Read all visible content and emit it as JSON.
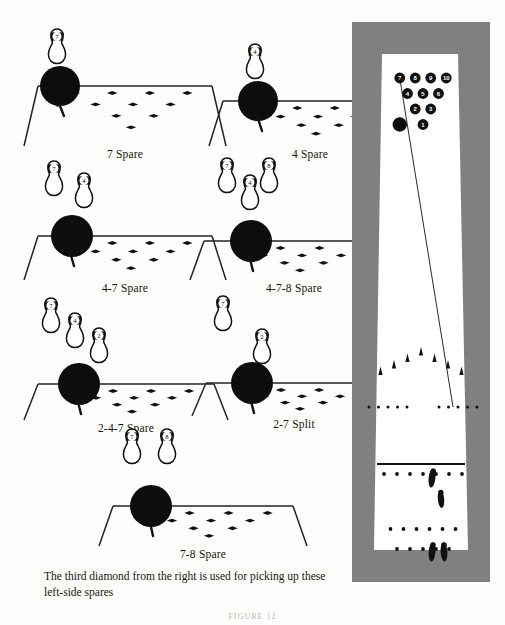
{
  "document": {
    "caption": "The third diamond from the right is used for picking up these left-side spares",
    "figure_label": "FIGURE 12"
  },
  "diagram_colors": {
    "ink": "#111111",
    "paper": "#ffffff",
    "page": "#fdfdfb",
    "mat": "#808080",
    "ball": "#0d0d0d",
    "pin_fill": "#ffffff",
    "pin_stroke": "#111111",
    "lane_line": "#222222"
  },
  "panels": [
    {
      "id": "panel-7-spare",
      "label": "7 Spare",
      "x": 30,
      "y": 28,
      "w": 190,
      "h": 118,
      "ball": {
        "cx": 30,
        "cy": 58,
        "r": 20
      },
      "arrow": {
        "x": 34,
        "y": 88,
        "angle": -22
      },
      "pins": [
        {
          "num": "7",
          "cx": 27,
          "cy": 18
        }
      ]
    },
    {
      "id": "panel-4-spare",
      "label": "4 Spare",
      "x": 215,
      "y": 28,
      "w": 190,
      "h": 118,
      "ball": {
        "cx": 43,
        "cy": 73,
        "r": 20
      },
      "arrow": {
        "x": 47,
        "y": 103,
        "angle": -18
      },
      "pins": [
        {
          "num": "4",
          "cx": 40,
          "cy": 33
        }
      ]
    },
    {
      "id": "panel-4-7-spare",
      "label": "4-7 Spare",
      "x": 30,
      "y": 158,
      "w": 190,
      "h": 122,
      "ball": {
        "cx": 42,
        "cy": 78,
        "r": 21
      },
      "arrow": {
        "x": 44,
        "y": 108,
        "angle": -16
      },
      "pins": [
        {
          "num": "7",
          "cx": 24,
          "cy": 20
        },
        {
          "num": "4",
          "cx": 54,
          "cy": 32
        }
      ]
    },
    {
      "id": "panel-4-7-8-spare",
      "label": "4-7-8 Spare",
      "x": 196,
      "y": 155,
      "w": 196,
      "h": 125,
      "ball": {
        "cx": 55,
        "cy": 86,
        "r": 21
      },
      "arrow": {
        "x": 57,
        "y": 116,
        "angle": -14
      },
      "pins": [
        {
          "num": "7",
          "cx": 31,
          "cy": 20
        },
        {
          "num": "4",
          "cx": 54,
          "cy": 37
        },
        {
          "num": "8",
          "cx": 73,
          "cy": 20
        }
      ]
    },
    {
      "id": "panel-2-4-7-spare",
      "label": "2-4-7 Spare",
      "x": 30,
      "y": 296,
      "w": 192,
      "h": 124,
      "ball": {
        "cx": 49,
        "cy": 88,
        "r": 21
      },
      "arrow": {
        "x": 51,
        "y": 118,
        "angle": -14
      },
      "pins": [
        {
          "num": "7",
          "cx": 21,
          "cy": 19
        },
        {
          "num": "4",
          "cx": 45,
          "cy": 34
        },
        {
          "num": "2",
          "cx": 69,
          "cy": 49
        }
      ]
    },
    {
      "id": "panel-2-7-split",
      "label": "2-7 Split",
      "x": 198,
      "y": 292,
      "w": 192,
      "h": 124,
      "ball": {
        "cx": 54,
        "cy": 91,
        "r": 21
      },
      "arrow": {
        "x": 56,
        "y": 121,
        "angle": -14
      },
      "pins": [
        {
          "num": "7",
          "cx": 25,
          "cy": 21
        },
        {
          "num": "2",
          "cx": 64,
          "cy": 54
        }
      ]
    },
    {
      "id": "panel-7-8-spare",
      "label": "7-8 Spare",
      "x": 105,
      "y": 428,
      "w": 196,
      "h": 118,
      "ball": {
        "cx": 46,
        "cy": 78,
        "r": 21
      },
      "arrow": {
        "x": 48,
        "y": 108,
        "angle": -12
      },
      "pins": [
        {
          "num": "7",
          "cx": 27,
          "cy": 18
        },
        {
          "num": "8",
          "cx": 62,
          "cy": 18
        }
      ]
    }
  ],
  "panel_lane": {
    "description": "trapezoid lane-end view with ten diamond aiming markers",
    "diamond_rows": [
      {
        "count": 4,
        "label": "back-row-diamonds"
      },
      {
        "count": 3,
        "label": "middle-row-diamonds"
      },
      {
        "count": 2,
        "label": "front-row-diamonds"
      },
      {
        "count": 1,
        "label": "apex-diamond"
      }
    ]
  },
  "lane_view": {
    "id": "full-lane-view",
    "x": 352,
    "y": 22,
    "w": 138,
    "h": 560,
    "mat_color": "#808080",
    "pin_rack": {
      "rows": [
        {
          "pins": [
            "7",
            "8",
            "9",
            "10"
          ]
        },
        {
          "pins": [
            "4",
            "5",
            "6"
          ]
        },
        {
          "pins": [
            "2",
            "3"
          ]
        },
        {
          "pins": [
            "1"
          ]
        }
      ]
    },
    "ball_at_pins": {
      "label": "ball-striking-7-pin"
    },
    "ball_path": {
      "label": "ball-path-line"
    },
    "arrows": {
      "count": 7,
      "label": "aiming-arrows"
    },
    "dot_rows": [
      {
        "label": "range-finder-dots-left",
        "count": 5
      },
      {
        "label": "range-finder-dots-right",
        "count": 5
      }
    ],
    "foul_line": {
      "label": "foul-line"
    },
    "approach_dots_front": {
      "count": 7
    },
    "approach_dots_back": {
      "count": 6
    },
    "approach_dots_rear": {
      "count": 5
    },
    "footprints": [
      {
        "label": "footprint-step-1"
      },
      {
        "label": "footprint-step-2"
      },
      {
        "label": "footprint-step-3"
      },
      {
        "label": "footprint-step-4"
      }
    ]
  }
}
